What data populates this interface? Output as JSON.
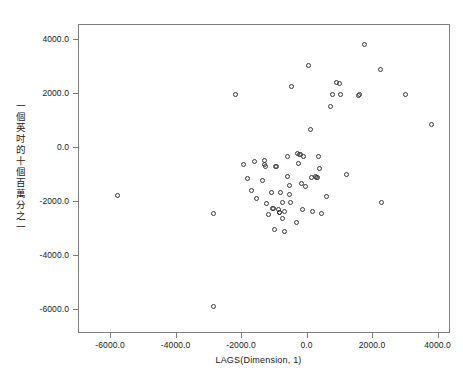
{
  "chart_data": {
    "type": "scatter",
    "title": "",
    "xlabel": "LAGS(Dimension, 1)",
    "ylabel": "一個英吋的十個百萬分之一",
    "xlim": [
      -6980,
      4380
    ],
    "ylim": [
      -6900,
      4560
    ],
    "xticks": [
      -6000,
      -4000,
      -2000,
      0,
      2000,
      4000
    ],
    "xticklabels": [
      "-6000.0",
      "-4000.0",
      "-2000.0",
      "0.0",
      "2000.0",
      "4000.0"
    ],
    "yticks": [
      4000,
      2000,
      0,
      -2000,
      -4000,
      -6000
    ],
    "yticklabels": [
      "4000.0",
      "2000.0",
      "0.0",
      "-2000.0",
      "-4000.0",
      "-6000.0"
    ],
    "grid": false,
    "legend": null,
    "marker": "open-circle",
    "marker_color": "#3a3a3a",
    "frame_color": "#7d7d7d",
    "background": "#ffffff",
    "n_points": 68,
    "points": [
      [
        -5800,
        -1750
      ],
      [
        -2880,
        -5870
      ],
      [
        -2860,
        -2420
      ],
      [
        -2210,
        2000
      ],
      [
        -1960,
        -600
      ],
      [
        -1820,
        -1130
      ],
      [
        -1700,
        -1570
      ],
      [
        -1620,
        -500
      ],
      [
        -1560,
        -1880
      ],
      [
        -1390,
        -1200
      ],
      [
        -1330,
        -450
      ],
      [
        -1310,
        -630
      ],
      [
        -1290,
        -700
      ],
      [
        -1250,
        -2050
      ],
      [
        -1180,
        -2480
      ],
      [
        -1090,
        -1660
      ],
      [
        -1060,
        -2230
      ],
      [
        -1040,
        -2250
      ],
      [
        -1010,
        -3030
      ],
      [
        -980,
        -700
      ],
      [
        -960,
        -690
      ],
      [
        -880,
        -2300
      ],
      [
        -870,
        -2380
      ],
      [
        -860,
        -2410
      ],
      [
        -830,
        -1640
      ],
      [
        -780,
        -2630
      ],
      [
        -770,
        -2040
      ],
      [
        -700,
        -2350
      ],
      [
        -690,
        -3080
      ],
      [
        -620,
        -320
      ],
      [
        -600,
        -1050
      ],
      [
        -560,
        -1720
      ],
      [
        -540,
        -1380
      ],
      [
        -520,
        -2030
      ],
      [
        -490,
        2280
      ],
      [
        -340,
        -2760
      ],
      [
        -320,
        -200
      ],
      [
        -290,
        -560
      ],
      [
        -250,
        -260
      ],
      [
        -230,
        -240
      ],
      [
        -180,
        -1320
      ],
      [
        -160,
        -2270
      ],
      [
        -120,
        -300
      ],
      [
        -60,
        -1420
      ],
      [
        20,
        3060
      ],
      [
        90,
        700
      ],
      [
        110,
        -1110
      ],
      [
        150,
        -2370
      ],
      [
        230,
        -1050
      ],
      [
        260,
        -1080
      ],
      [
        300,
        -1090
      ],
      [
        330,
        -300
      ],
      [
        360,
        -750
      ],
      [
        420,
        -2440
      ],
      [
        590,
        -1800
      ],
      [
        700,
        1550
      ],
      [
        760,
        2000
      ],
      [
        880,
        2440
      ],
      [
        960,
        2380
      ],
      [
        1010,
        1980
      ],
      [
        1180,
        -1000
      ],
      [
        1560,
        1960
      ],
      [
        1600,
        1980
      ],
      [
        1740,
        3830
      ],
      [
        2220,
        2920
      ],
      [
        2270,
        -2020
      ],
      [
        2980,
        1980
      ],
      [
        3780,
        880
      ]
    ]
  }
}
